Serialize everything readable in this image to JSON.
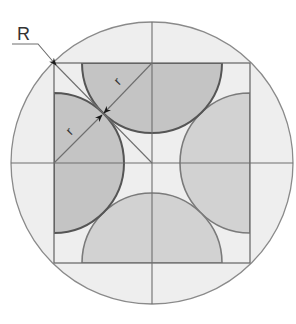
{
  "diagram": {
    "labels": {
      "outer_radius": "R",
      "inner_radius_top": "r",
      "inner_radius_left": "r"
    },
    "colors": {
      "background": "#ffffff",
      "outer_circle_fill": "#eeeeee",
      "outer_circle_stroke": "#8a8a8a",
      "square_stroke": "#6e6e6e",
      "semicircle_dark_fill": "#c4c4c4",
      "semicircle_dark_stroke": "#555555",
      "semicircle_light_fill": "#d2d2d2",
      "semicircle_light_stroke": "#7a7a7a",
      "arrow": "#1a1a1a"
    }
  }
}
